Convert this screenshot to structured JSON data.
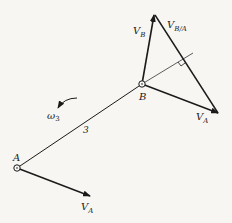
{
  "diagram": {
    "title": "",
    "link_label": "3",
    "angular_velocity": {
      "symbol": "ω",
      "subscript": "3"
    },
    "points": {
      "A": {
        "label": "A",
        "x": 17,
        "y": 168
      },
      "B": {
        "label": "B",
        "x": 142,
        "y": 84
      }
    },
    "vectors": {
      "VA_at_A": {
        "label": "V",
        "subscript": "A"
      },
      "VA_at_B": {
        "label": "V",
        "subscript": "A"
      },
      "VB": {
        "label": "V",
        "subscript": "B"
      },
      "VBA": {
        "label": "V",
        "subscript": "B/A"
      }
    },
    "colors": {
      "ink": "#1a1a1a",
      "background": "#f7f6f2"
    }
  }
}
